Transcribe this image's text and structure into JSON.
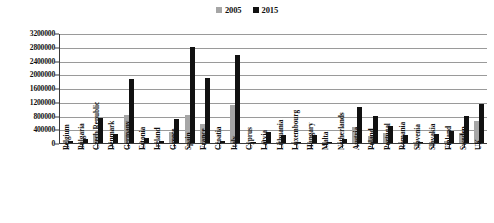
{
  "chart_data": {
    "type": "bar",
    "title": "",
    "subtitle": "",
    "xlabel": "",
    "ylabel": "",
    "ylim": [
      0,
      3200000
    ],
    "ytick_step": 400000,
    "yticks": [
      "3200000",
      "2800000",
      "2400000",
      "2000000",
      "1600000",
      "1200000",
      "800000",
      "400000",
      "0"
    ],
    "grid": true,
    "legend_position": "top-center",
    "legend": [
      {
        "name": "2005",
        "color": "#a6a6a6"
      },
      {
        "name": "2015",
        "color": "#111111"
      }
    ],
    "categories": [
      "Belgium",
      "Bulgaria",
      "Czech Republic",
      "Denmark",
      "Germany",
      "Estonia",
      "Ireland",
      "Greece",
      "Spain",
      "France",
      "Croatia",
      "Italy",
      "Cyprus",
      "Latvia",
      "Lithuania",
      "Luxembourg",
      "Hungary",
      "Malta",
      "Netherlands",
      "Austria",
      "Poland",
      "Portugal",
      "Romania",
      "Slovenia",
      "Slovakia",
      "Finland",
      "Sweden",
      "UK"
    ],
    "series": [
      {
        "name": "2005",
        "color": "#a6a6a6",
        "values": [
          30000,
          25000,
          260000,
          40000,
          820000,
          20000,
          15000,
          330000,
          820000,
          550000,
          20000,
          1100000,
          5000,
          60000,
          30000,
          5000,
          30000,
          2000,
          15000,
          480000,
          200000,
          300000,
          20000,
          10000,
          40000,
          60000,
          280000,
          640000
        ]
      },
      {
        "name": "2015",
        "color": "#111111",
        "values": [
          60000,
          110000,
          720000,
          260000,
          1870000,
          150000,
          70000,
          690000,
          2780000,
          1880000,
          70000,
          2570000,
          10000,
          320000,
          230000,
          10000,
          220000,
          5000,
          110000,
          1050000,
          790000,
          500000,
          220000,
          40000,
          250000,
          350000,
          790000,
          1130000
        ]
      }
    ]
  }
}
